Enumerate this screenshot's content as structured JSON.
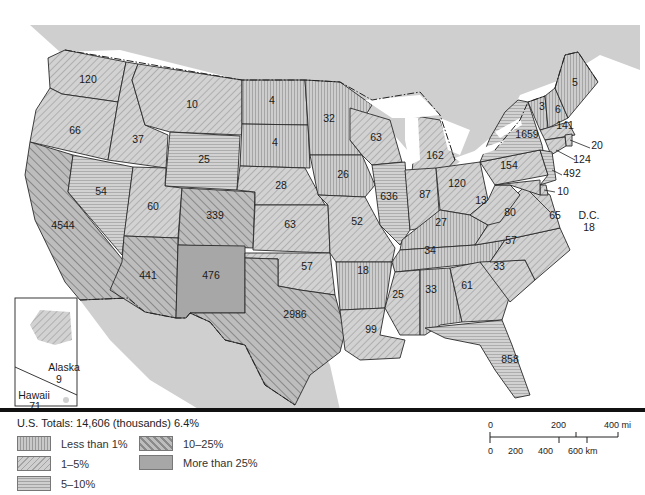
{
  "map": {
    "title_summary": {
      "label": "U.S. Totals:",
      "value": "14,606 (thousands) 6.4%"
    },
    "states": [
      {
        "abbr": "WA",
        "value": "120",
        "category": "1-5%"
      },
      {
        "abbr": "OR",
        "value": "66",
        "category": "1-5%"
      },
      {
        "abbr": "CA",
        "value": "4544",
        "category": "10-25%"
      },
      {
        "abbr": "ID",
        "value": "37",
        "category": "1-5%"
      },
      {
        "abbr": "NV",
        "value": "54",
        "category": "5-10%"
      },
      {
        "abbr": "MT",
        "value": "10",
        "category": "1-5%"
      },
      {
        "abbr": "WY",
        "value": "25",
        "category": "5-10%"
      },
      {
        "abbr": "UT",
        "value": "60",
        "category": "1-5%"
      },
      {
        "abbr": "CO",
        "value": "339",
        "category": "10-25%"
      },
      {
        "abbr": "AZ",
        "value": "441",
        "category": "10-25%"
      },
      {
        "abbr": "NM",
        "value": "476",
        "category": "More than 25%"
      },
      {
        "abbr": "ND",
        "value": "4",
        "category": "Less than 1%"
      },
      {
        "abbr": "SD",
        "value": "4",
        "category": "Less than 1%"
      },
      {
        "abbr": "NE",
        "value": "28",
        "category": "1-5%"
      },
      {
        "abbr": "KS",
        "value": "63",
        "category": "1-5%"
      },
      {
        "abbr": "OK",
        "value": "57",
        "category": "1-5%"
      },
      {
        "abbr": "TX",
        "value": "2986",
        "category": "10-25%"
      },
      {
        "abbr": "MN",
        "value": "32",
        "category": "Less than 1%"
      },
      {
        "abbr": "IA",
        "value": "26",
        "category": "Less than 1%"
      },
      {
        "abbr": "MO",
        "value": "52",
        "category": "1-5%"
      },
      {
        "abbr": "AR",
        "value": "18",
        "category": "Less than 1%"
      },
      {
        "abbr": "LA",
        "value": "99",
        "category": "1-5%"
      },
      {
        "abbr": "WI",
        "value": "63",
        "category": "1-5%"
      },
      {
        "abbr": "IL",
        "value": "636",
        "category": "5-10%"
      },
      {
        "abbr": "MI",
        "value": "162",
        "category": "1-5%"
      },
      {
        "abbr": "IN",
        "value": "87",
        "category": "1-5%"
      },
      {
        "abbr": "OH",
        "value": "120",
        "category": "1-5%"
      },
      {
        "abbr": "KY",
        "value": "27",
        "category": "Less than 1%"
      },
      {
        "abbr": "TN",
        "value": "34",
        "category": "Less than 1%"
      },
      {
        "abbr": "MS",
        "value": "25",
        "category": "1-5%"
      },
      {
        "abbr": "AL",
        "value": "33",
        "category": "Less than 1%"
      },
      {
        "abbr": "GA",
        "value": "61",
        "category": "1-5%"
      },
      {
        "abbr": "FL",
        "value": "858",
        "category": "5-10%"
      },
      {
        "abbr": "SC",
        "value": "33",
        "category": "1-5%"
      },
      {
        "abbr": "NC",
        "value": "57",
        "category": "1-5%"
      },
      {
        "abbr": "VA",
        "value": "80",
        "category": "1-5%"
      },
      {
        "abbr": "WV",
        "value": "13",
        "category": "1-5%"
      },
      {
        "abbr": "PA",
        "value": "154",
        "category": "1-5%"
      },
      {
        "abbr": "NY",
        "value": "1659",
        "category": "5-10%"
      },
      {
        "abbr": "VT",
        "value": "3",
        "category": "Less than 1%"
      },
      {
        "abbr": "NH",
        "value": "6",
        "category": "Less than 1%"
      },
      {
        "abbr": "ME",
        "value": "5",
        "category": "Less than 1%"
      },
      {
        "abbr": "MA",
        "value": "141",
        "category": "1-5%"
      },
      {
        "abbr": "RI",
        "value": "20",
        "category": "1-5%"
      },
      {
        "abbr": "CT",
        "value": "124",
        "category": "1-5%"
      },
      {
        "abbr": "NJ",
        "value": "492",
        "category": "5-10%"
      },
      {
        "abbr": "DE",
        "value": "10",
        "category": "1-5%"
      },
      {
        "abbr": "MD",
        "value": "65",
        "category": "1-5%"
      },
      {
        "abbr": "DC",
        "label": "D.C.",
        "value": "18",
        "category": "1-5%"
      },
      {
        "abbr": "AK",
        "label": "Alaska",
        "value": "9",
        "category": "1-5%"
      },
      {
        "abbr": "HI",
        "label": "Hawaii",
        "value": "71",
        "category": "5-10%"
      }
    ]
  },
  "legend": {
    "items": [
      {
        "key": "lt1",
        "label": "Less than 1%"
      },
      {
        "key": "p15",
        "label": "1–5%"
      },
      {
        "key": "p510",
        "label": "5–10%"
      },
      {
        "key": "p1025",
        "label": "10–25%"
      },
      {
        "key": "p25",
        "label": "More than 25%"
      }
    ]
  },
  "scale_bar": {
    "miles": {
      "ticks": [
        "0",
        "200",
        "400 mi"
      ]
    },
    "km": {
      "ticks": [
        "0",
        "200",
        "400",
        "600 km"
      ]
    }
  },
  "colors": {
    "land_foreign": "#cfcfcf",
    "water": "#ffffff",
    "fill_more_than_25": "#a7a7a7",
    "border": "#222222"
  }
}
